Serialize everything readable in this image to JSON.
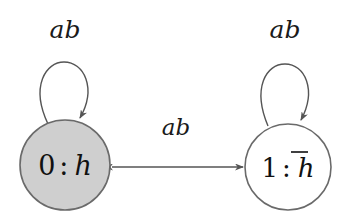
{
  "figure": {
    "width": 347,
    "height": 216,
    "background": "#ffffff"
  },
  "colors": {
    "accepting_fill": "#cfcfcf",
    "plain_fill": "#ffffff",
    "node_stroke": "#6a6a6a",
    "edge_stroke": "#555555",
    "text": "#111111"
  },
  "nodes": [
    {
      "id": "state-0",
      "index": "0",
      "separator": ":",
      "variable": "h",
      "overlined": false,
      "filled": true,
      "cx": 65,
      "cy": 165,
      "r": 45
    },
    {
      "id": "state-1",
      "index": "1",
      "separator": ":",
      "variable": "h",
      "overlined": true,
      "filled": false,
      "cx": 288,
      "cy": 167,
      "r": 43
    }
  ],
  "edges": [
    {
      "id": "self-loop-0",
      "from": "state-0",
      "to": "state-0",
      "label": "ab",
      "label_x": 65,
      "label_y": 38,
      "kind": "self-loop"
    },
    {
      "id": "self-loop-1",
      "from": "state-1",
      "to": "state-1",
      "label": "ab",
      "label_x": 285,
      "label_y": 38,
      "kind": "self-loop"
    },
    {
      "id": "edge-bidirectional",
      "from": "state-1",
      "to": "state-0",
      "label": "ab",
      "label_x": 176,
      "label_y": 135,
      "kind": "bidirectional"
    }
  ]
}
